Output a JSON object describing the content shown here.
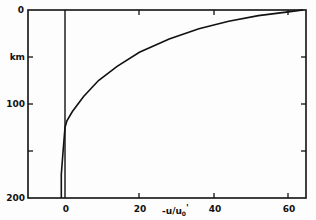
{
  "chart_data": {
    "type": "line",
    "title": "",
    "xlabel": "-u/u0'",
    "ylabel": "km",
    "xlim": [
      -10,
      65
    ],
    "ylim": [
      200,
      0
    ],
    "y_inverted": true,
    "x_ticks": [
      0,
      20,
      40,
      60
    ],
    "x_tick_labels": [
      "0",
      "20",
      "40",
      "60"
    ],
    "y_ticks": [
      0,
      50,
      100,
      150,
      200
    ],
    "y_tick_labels": [
      "0",
      "km",
      "100",
      "",
      "200"
    ],
    "grid": false,
    "legend": null,
    "reference_line": {
      "x": 0,
      "description": "vertical line at x = 0"
    },
    "series": [
      {
        "name": "-u/u0' profile",
        "x": [
          64,
          60,
          52,
          44,
          36,
          28,
          20,
          14,
          9,
          5,
          2,
          0.5,
          0,
          -0.5,
          -1,
          -1
        ],
        "y": [
          0,
          2,
          6,
          12,
          20,
          31,
          45,
          60,
          75,
          92,
          108,
          118,
          125,
          150,
          175,
          200
        ]
      }
    ]
  },
  "labels": {
    "y0": "0",
    "ykm": "km",
    "y100": "100",
    "y200": "200",
    "x0": "0",
    "x20": "20",
    "x40": "40",
    "x60": "60",
    "xtitle_main": "-u/u",
    "xtitle_sub": "0",
    "xtitle_prime": "'"
  }
}
